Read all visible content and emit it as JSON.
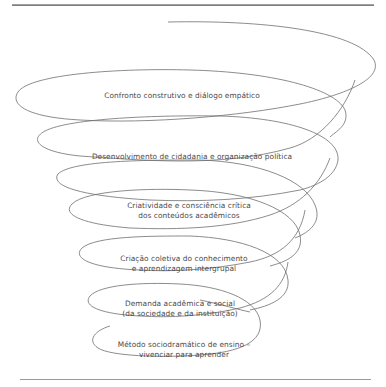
{
  "diagram": {
    "type": "spiral",
    "stroke_color": "#6e6e6e",
    "text_color": "#4a4a4a",
    "stages": [
      {
        "line1": "Confronto construtivo e diálogo empático",
        "line2": ""
      },
      {
        "line1": "Desenvolvimento de cidadania e organização política",
        "line2": ""
      },
      {
        "line1": "Criatividade e consciência crítica",
        "line2": "dos conteúdos acadêmicos"
      },
      {
        "line1": "Criação coletiva do conhecimento",
        "line2": "e aprendizagem intergrupal"
      },
      {
        "line1": "Demanda acadêmica e social",
        "line2": "(da sociedade e da instituição)"
      },
      {
        "line1": "Método sociodramático de ensino –",
        "line2": "vivenciar para aprender"
      }
    ]
  }
}
